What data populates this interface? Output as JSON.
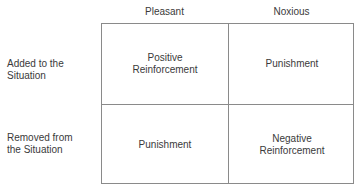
{
  "columns": [
    "Pleasant",
    "Noxious"
  ],
  "rows": [
    {
      "label_line1": "Added to the",
      "label_line2": "Situation"
    },
    {
      "label_line1": "Removed from",
      "label_line2": "the Situation"
    }
  ],
  "cells": {
    "added_pleasant": {
      "line1": "Positive",
      "line2": "Reinforcement"
    },
    "added_noxious": {
      "line1": "Punishment",
      "line2": ""
    },
    "removed_pleasant": {
      "line1": "Punishment",
      "line2": ""
    },
    "removed_noxious": {
      "line1": "Negative",
      "line2": "Reinforcement"
    }
  }
}
